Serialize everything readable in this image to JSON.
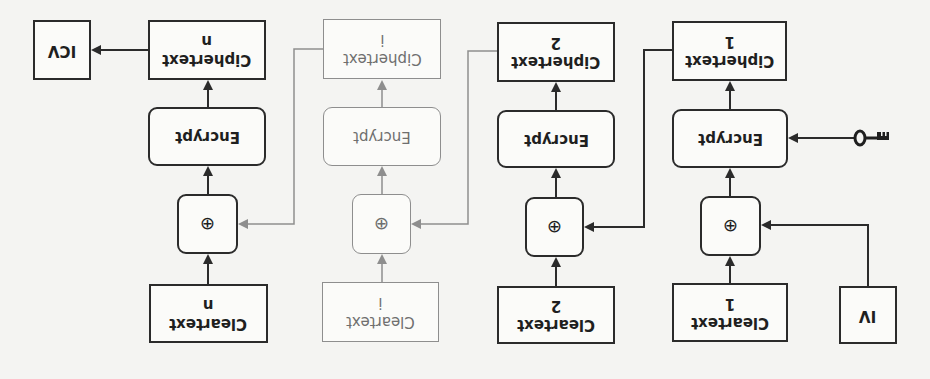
{
  "diagram": {
    "orientation": "rotated-180",
    "colors": {
      "line": "#2b2b2b",
      "faded_line": "#8e8e8e",
      "background": "#f4f4f2"
    },
    "columns": [
      {
        "id": "block-n",
        "ciphertext": "Ciphertext\nn",
        "encrypt": "Encrypt",
        "xor": "⊕",
        "cleartext": "Cleartext\nn",
        "faded": false
      },
      {
        "id": "block-i",
        "ciphertext": "Ciphertext\ni",
        "encrypt": "Encrypt",
        "xor": "⊕",
        "cleartext": "Cleartext\ni",
        "faded": true
      },
      {
        "id": "block-2",
        "ciphertext": "Ciphertext\n2",
        "encrypt": "Encrypt",
        "xor": "⊕",
        "cleartext": "Cleartext\n2",
        "faded": false
      },
      {
        "id": "block-1",
        "ciphertext": "Ciphertext\n1",
        "encrypt": "Encrypt",
        "xor": "⊕",
        "cleartext": "Cleartext\n1",
        "faded": false
      }
    ],
    "icv": "ICV",
    "iv": "IV",
    "key_icon": "key-icon"
  }
}
